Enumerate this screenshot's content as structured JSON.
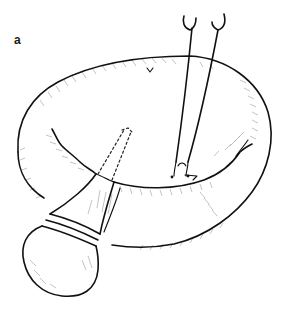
{
  "figure": {
    "panel_label": "a",
    "colors": {
      "background": "#ffffff",
      "ink": "#111111",
      "shading": "#9a9a9a"
    },
    "elements": [
      {
        "name": "ring-cushion",
        "label": ""
      },
      {
        "name": "bulb-instrument",
        "label": ""
      },
      {
        "name": "dashed-insertion-path",
        "label": ""
      },
      {
        "name": "forceps",
        "label": ""
      }
    ]
  }
}
